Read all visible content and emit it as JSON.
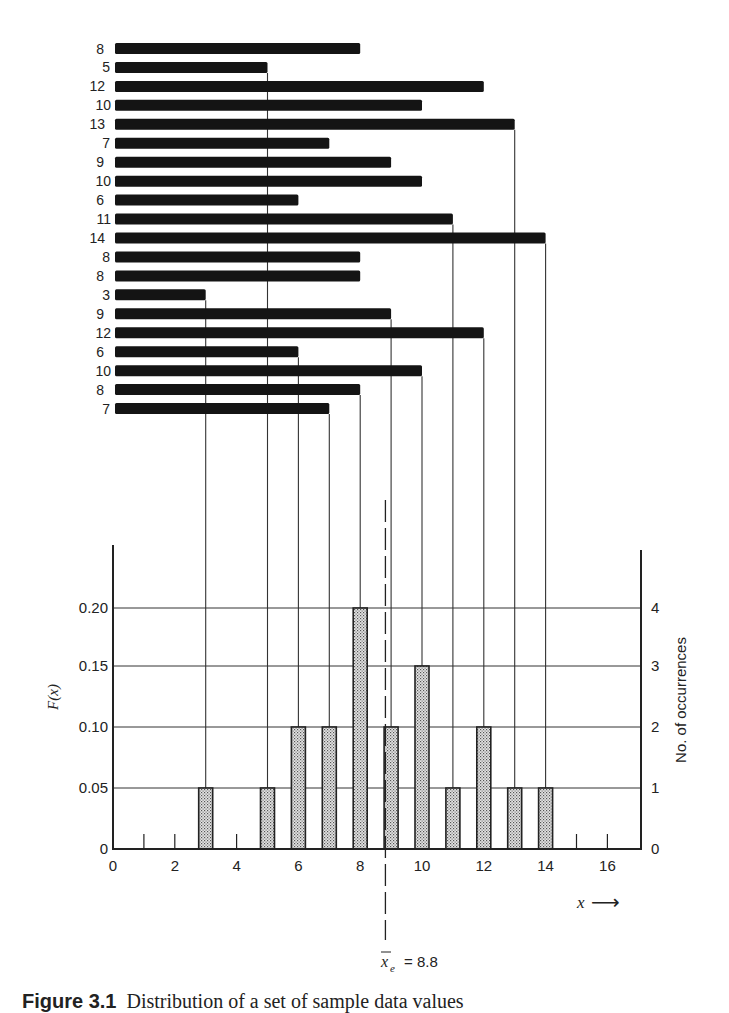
{
  "chart_data": {
    "type": "bar",
    "title": "",
    "upper_panel": {
      "type": "horizontal-bar",
      "description": "Individual sample values drawn as horizontal bars, with vertical drop lines to the histogram below",
      "values": [
        8,
        5,
        12,
        10,
        13,
        7,
        9,
        10,
        6,
        11,
        14,
        8,
        8,
        3,
        9,
        12,
        6,
        10,
        8,
        7
      ]
    },
    "lower_panel": {
      "type": "bar",
      "categories": [
        3,
        5,
        6,
        7,
        8,
        9,
        10,
        11,
        12,
        13,
        14
      ],
      "series": [
        {
          "name": "No. of occurrences",
          "values": [
            1,
            1,
            2,
            2,
            4,
            2,
            3,
            1,
            2,
            1,
            1
          ]
        },
        {
          "name": "F(x)",
          "values": [
            0.05,
            0.05,
            0.1,
            0.1,
            0.2,
            0.1,
            0.15,
            0.05,
            0.1,
            0.05,
            0.05
          ]
        }
      ],
      "xlabel": "x",
      "ylabel_left": "F(x)",
      "ylabel_right": "No. of occurrences",
      "xlim": [
        0,
        17
      ],
      "ylim_left": [
        0,
        0.25
      ],
      "ylim_right": [
        0,
        5
      ],
      "x_ticks": [
        "0",
        "2",
        "4",
        "6",
        "8",
        "10",
        "12",
        "14",
        "16"
      ],
      "y_ticks_left": [
        "0",
        "0.05",
        "0.10",
        "0.15",
        "0.20"
      ],
      "y_ticks_right": [
        "0",
        "1",
        "2",
        "3",
        "4"
      ],
      "grid": true,
      "annotation": {
        "label_var": "x",
        "label_sub": "e",
        "label_eq": "=",
        "label_value": "8.8",
        "x": 8.8,
        "style": "dashed vertical line"
      }
    }
  },
  "labels": {
    "f_of_x": "F(x)",
    "occurrences": "No. of occurrences",
    "x_axis": "x",
    "arrow": "⟶",
    "mean_var": "x",
    "mean_sub": "e",
    "mean_eq": "= 8.8"
  },
  "caption": {
    "number": "Figure 3.1",
    "text": "Distribution of a set of sample data values"
  }
}
